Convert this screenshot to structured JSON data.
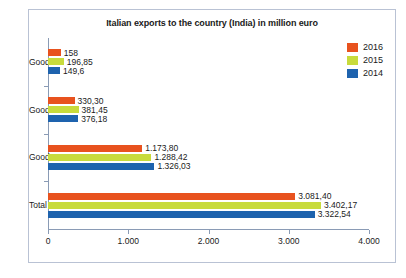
{
  "chart_data": {
    "type": "bar",
    "orientation": "horizontal",
    "title": "Italian exports to the country (India) in million euro",
    "xlabel": "",
    "ylabel": "",
    "categories": [
      "Good C",
      "Good B",
      "Good A",
      "Total"
    ],
    "series": [
      {
        "name": "2016",
        "color": "#e8521e",
        "values": [
          158,
          330.3,
          1173.8,
          3081.4
        ],
        "labels": [
          "158",
          "330,30",
          "1.173,80",
          "3.081,40"
        ]
      },
      {
        "name": "2015",
        "color": "#c8db3c",
        "values": [
          196.85,
          381.45,
          1288.42,
          3402.17
        ],
        "labels": [
          "196,85",
          "381,45",
          "1.288,42",
          "3.402,17"
        ]
      },
      {
        "name": "2014",
        "color": "#1e63ae",
        "values": [
          149.6,
          376.18,
          1326.03,
          3322.54
        ],
        "labels": [
          "149,6",
          "376,18",
          "1.326,03",
          "3.322,54"
        ]
      }
    ],
    "xlim": [
      0,
      4000
    ],
    "xticks": [
      0,
      1000,
      2000,
      3000,
      4000
    ],
    "xtick_labels": [
      "0",
      "1.000",
      "2.000",
      "3.000",
      "4.000"
    ],
    "grid": false,
    "legend_position": "top-right",
    "legend_entries": [
      "2016",
      "2015",
      "2014"
    ]
  }
}
